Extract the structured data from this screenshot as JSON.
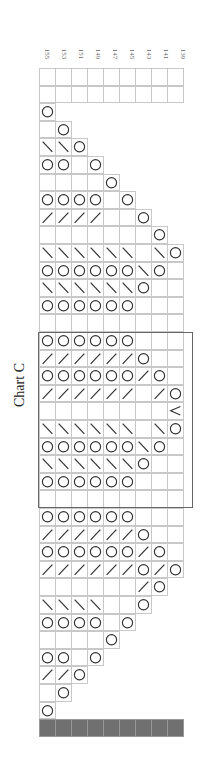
{
  "title": "Chart C",
  "column_labels": [
    "155",
    "153",
    "151",
    "149",
    "147",
    "145",
    "143",
    "141",
    "139"
  ],
  "legend_symbols": {
    "O": "yarn-over",
    "/": "k2tog-right-slant",
    "\\": "ssk-left-slant",
    "<": "decrease-chevron",
    "_": "knit-blank",
    "#": "no-stitch-dark"
  },
  "colors": {
    "grid_line": "#c8c8c8",
    "dark_row": "#707070",
    "symbol": "#333333",
    "repeat_box": "#666666"
  },
  "repeat_box": {
    "start_row": 15,
    "end_row": 24
  },
  "rows": [
    "_________",
    "_________",
    "O",
    "_O",
    "\\\\O",
    "OO_O",
    "____O",
    "OOOO_O",
    "////__O",
    "_______O",
    "\\\\\\\\\\\\_\\O",
    "OOOOOO\\O_",
    "\\\\\\\\\\\\O__",
    "OOOOOO___",
    "_________",
    "OOOOOO___",
    "//////O__",
    "OOOOOO/O_",
    "//////_/O",
    "________<",
    "\\\\\\\\\\\\_\\O",
    "OOOOOO\\O_",
    "\\\\\\\\\\\\O__",
    "OOOOOO___",
    "_________",
    "OOOOOO___",
    "//////O__",
    "OOOOOO/O_",
    "//////O/O",
    "______/O",
    "\\\\\\\\__O",
    "OOOO_O",
    "____O",
    "OO_O",
    "//O",
    "_O",
    "O",
    "#########"
  ]
}
